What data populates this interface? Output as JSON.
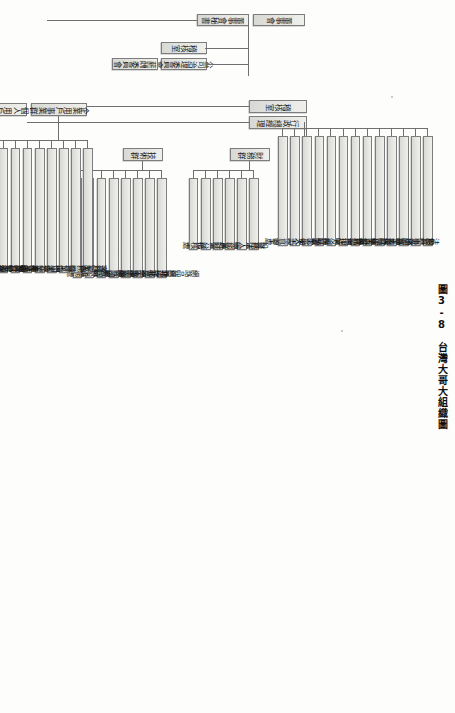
{
  "figure": {
    "number": "圖3-8",
    "title": "台灣大哥大組織圖"
  },
  "chart_type": "organization-chart",
  "orientation": "rotated-90-landscape",
  "top": {
    "nodes": [
      {
        "id": "board",
        "label": "董事會"
      },
      {
        "id": "secretary",
        "label": "董事會秘書"
      }
    ]
  },
  "executive": {
    "nodes": [
      {
        "id": "audit-office",
        "label": "稽核室"
      },
      {
        "id": "admin-gm",
        "label": "行政總經理"
      },
      {
        "id": "tech-gm",
        "label": "技術總經理"
      },
      {
        "id": "legal-committee",
        "label": "公司治理委員會"
      },
      {
        "id": "comp-committee",
        "label": "薪酬委員會"
      }
    ]
  },
  "groups": [
    {
      "id": "admin-group",
      "label": "行政總經理",
      "units": [
        {
          "label": "法務室"
        },
        {
          "label": "公共事務處"
        },
        {
          "label": "用戶暨通路技術處"
        },
        {
          "label": "網路技術處"
        },
        {
          "label": "企業寬頻技術處"
        },
        {
          "label": "系統建置維運處"
        },
        {
          "label": "企業服務採購處"
        },
        {
          "label": "資源採購處"
        },
        {
          "label": "資訊治理及應用服務處"
        },
        {
          "label": "採購處"
        },
        {
          "label": "行政管理處"
        },
        {
          "label": "勞工安全衛生室"
        },
        {
          "label": "人力資源處"
        }
      ]
    },
    {
      "id": "finance-group",
      "label": "財務群",
      "units": [
        {
          "label": "財務處"
        },
        {
          "label": "投資法人關係處"
        },
        {
          "label": "帳務處"
        },
        {
          "label": "會計處"
        },
        {
          "label": "經營分析處"
        },
        {
          "label": "稽核處"
        }
      ]
    },
    {
      "id": "tech-group",
      "label": "技術群",
      "units": [
        {
          "label": "網路品質暨技術支援處"
        },
        {
          "label": "網路經營管理處"
        },
        {
          "label": "北一區網路經營處"
        },
        {
          "label": "北二區網路經營處"
        },
        {
          "label": "中區網路經營處"
        },
        {
          "label": "南區網路經營處"
        },
        {
          "label": "系統設計處"
        },
        {
          "label": "工務處"
        }
      ]
    },
    {
      "id": "consumer-group",
      "label": "個人用戶事業群",
      "partner_label": "企業用戶事業群",
      "units": [
        {
          "label": "客戶服務處"
        },
        {
          "label": "通路業務暨管理處"
        },
        {
          "label": "營業處"
        },
        {
          "label": "行銷業務處"
        },
        {
          "label": "加值業務處"
        },
        {
          "label": "商業業務處"
        },
        {
          "label": "產品及行銷處"
        },
        {
          "label": "法律暨服務事業處"
        },
        {
          "label": "品牌管理暨客戶關係處"
        },
        {
          "label": "客戶忠誠暨加值服務行銷處"
        },
        {
          "label": "客戶服務暨電子商務處"
        }
      ]
    }
  ]
}
